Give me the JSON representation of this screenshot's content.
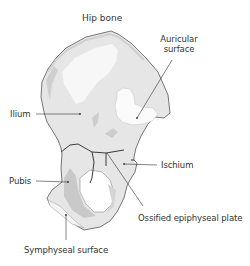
{
  "figure": {
    "title": "Hip bone",
    "colors": {
      "bone_fill": "#e6e6e6",
      "bone_highlight": "#f7f7f7",
      "bone_shadow": "#c9c9c9",
      "outline": "#555555",
      "plate_line": "#3a3a3a",
      "leader_line": "#333333",
      "text": "#333333"
    },
    "labels": {
      "auricular_line1": "Auricular",
      "auricular_line2": "surface",
      "ilium": "Ilium",
      "ischium": "Ischium",
      "pubis": "Pubis",
      "ossified_plate": "Ossified epiphyseal plate",
      "symphyseal": "Symphyseal surface"
    }
  }
}
